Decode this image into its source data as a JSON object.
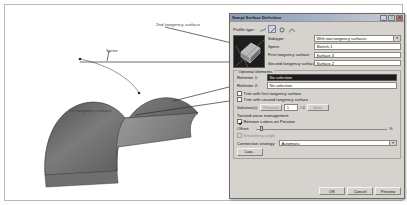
{
  "viewport": {
    "labels": {
      "second_tangency": "2nd tangency surface",
      "spine": "Spine",
      "first_tangency": "1st tangency surface"
    }
  },
  "dialog": {
    "title": "Swept Surface Definition",
    "window_buttons": {
      "minimize": "_",
      "maximize": "□",
      "close": "✕"
    },
    "profile_type": {
      "label": "Profile type :",
      "tools": [
        {
          "name": "explicit-profile-icon",
          "selected": false
        },
        {
          "name": "line-profile-icon",
          "selected": true
        },
        {
          "name": "circle-profile-icon",
          "selected": false
        },
        {
          "name": "conic-profile-icon",
          "selected": false
        }
      ]
    },
    "fields": {
      "subtype_label": "Subtype:",
      "subtype_value": "With two tangency surfaces",
      "spine_label": "Spine:",
      "spine_value": "Sketch.1",
      "first_tangency_label": "First tangency surface:",
      "first_tangency_value": "Surface.3",
      "second_tangency_label": "Second tangency surface:",
      "second_tangency_value": "Surface.2"
    },
    "optional": {
      "title": "Optional elements",
      "relimiter1_label": "Relimiter 1:",
      "relimiter1_value": "No selection",
      "relimiter2_label": "Relimiter 2:",
      "relimiter2_value": "No selection",
      "trim_first_label": "Trim with first tangency surface",
      "trim_first_checked": false,
      "trim_second_label": "Trim with second tangency surface",
      "trim_second_checked": false,
      "solutions_label": "Solution(s):",
      "solutions_prev": "Previous",
      "solutions_next": "Next",
      "solutions_count": "1",
      "solutions_total": "/ 4"
    },
    "twisted": {
      "section_label": "Twisted areas management",
      "remove_cutters_label": "Remove cutters on Preview",
      "remove_cutters_checked": true,
      "angle_label": "Offset:",
      "angle_unit": "%",
      "angle_value": "0",
      "smooth_label": "Smoothing angle",
      "smooth_checked": false,
      "connection_label": "Connection strategy:",
      "connection_value": "Automatic",
      "law_button": "Law..."
    },
    "footer": {
      "ok": "OK",
      "cancel": "Cancel",
      "preview": "Preview"
    }
  }
}
